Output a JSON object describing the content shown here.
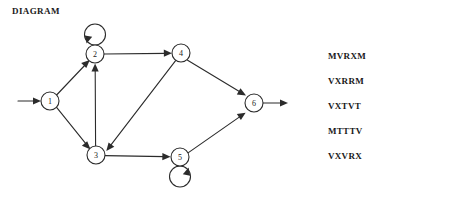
{
  "diagram": {
    "title": "DIAGRAM",
    "nodes": [
      {
        "id": "1",
        "label": "1",
        "cx": 50,
        "cy": 101,
        "r": 9
      },
      {
        "id": "2",
        "label": "2",
        "cx": 95,
        "cy": 54,
        "r": 9
      },
      {
        "id": "3",
        "label": "3",
        "cx": 96,
        "cy": 155,
        "r": 9
      },
      {
        "id": "4",
        "label": "4",
        "cx": 181,
        "cy": 53,
        "r": 9
      },
      {
        "id": "5",
        "label": "5",
        "cx": 180,
        "cy": 157,
        "r": 9
      },
      {
        "id": "6",
        "label": "6",
        "cx": 254,
        "cy": 103,
        "r": 9
      }
    ],
    "edges": [
      {
        "from": "entry",
        "to": "1",
        "kind": "entry"
      },
      {
        "from": "1",
        "to": "2",
        "kind": "straight"
      },
      {
        "from": "1",
        "to": "3",
        "kind": "straight"
      },
      {
        "from": "2",
        "to": "2",
        "kind": "self-loop-top"
      },
      {
        "from": "2",
        "to": "4",
        "kind": "straight"
      },
      {
        "from": "3",
        "to": "2",
        "kind": "straight"
      },
      {
        "from": "3",
        "to": "5",
        "kind": "straight"
      },
      {
        "from": "4",
        "to": "3",
        "kind": "straight"
      },
      {
        "from": "4",
        "to": "6",
        "kind": "straight"
      },
      {
        "from": "5",
        "to": "5",
        "kind": "self-loop-bottom"
      },
      {
        "from": "5",
        "to": "6",
        "kind": "straight"
      },
      {
        "from": "6",
        "to": "exit",
        "kind": "exit"
      }
    ],
    "stroke_color": "#2b2b2b",
    "node_fill": "#ffffff"
  },
  "sentences": {
    "title": "LEGAL SENTENCES",
    "items": [
      "MVRXM",
      "VXRRM",
      "VXTVT",
      "MTTTV",
      "VXVRX"
    ]
  }
}
